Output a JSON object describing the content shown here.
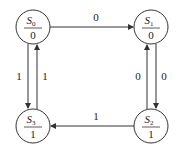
{
  "diagram": {
    "title": "",
    "states": [
      {
        "id": "S0",
        "name": "S",
        "sub": "0",
        "output": "0",
        "cx": 33,
        "cy": 27
      },
      {
        "id": "S1",
        "name": "S",
        "sub": "1",
        "output": "0",
        "cx": 151,
        "cy": 27
      },
      {
        "id": "S2",
        "name": "S",
        "sub": "2",
        "output": "1",
        "cx": 151,
        "cy": 126
      },
      {
        "id": "S3",
        "name": "S",
        "sub": "3",
        "output": "1",
        "cx": 33,
        "cy": 126
      }
    ],
    "transitions": [
      {
        "from": "S0",
        "to": "S1",
        "label": "0"
      },
      {
        "from": "S0",
        "to": "S3",
        "label": "1"
      },
      {
        "from": "S3",
        "to": "S0",
        "label": "1"
      },
      {
        "from": "S1",
        "to": "S2",
        "label": "0"
      },
      {
        "from": "S2",
        "to": "S1",
        "label": "0"
      },
      {
        "from": "S2",
        "to": "S3",
        "label": "1"
      }
    ],
    "colors": {
      "stroke": "#333333",
      "text": "#222222"
    }
  }
}
